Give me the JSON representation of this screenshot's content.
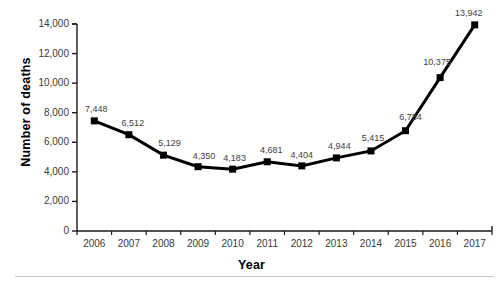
{
  "chart_data": {
    "type": "line",
    "title": "",
    "xlabel": "Year",
    "ylabel": "Number of deaths",
    "categories": [
      "2006",
      "2007",
      "2008",
      "2009",
      "2010",
      "2011",
      "2012",
      "2013",
      "2014",
      "2015",
      "2016",
      "2017"
    ],
    "values": [
      7448,
      6512,
      5129,
      4350,
      4183,
      4681,
      4404,
      4944,
      5415,
      6784,
      10375,
      13942
    ],
    "point_labels": [
      "7,448",
      "6,512",
      "5,129",
      "4,350",
      "4,183",
      "4,681",
      "4,404",
      "4,944",
      "5,415",
      "6,784",
      "10,375",
      "13,942"
    ],
    "ylim": [
      0,
      14000
    ],
    "ytick_values": [
      0,
      2000,
      4000,
      6000,
      8000,
      10000,
      12000,
      14000
    ],
    "ytick_labels": [
      "0",
      "2,000",
      "4,000",
      "6,000",
      "8,000",
      "10,000",
      "12,000",
      "14,000"
    ],
    "xtick_labels": [
      "2006",
      "2007",
      "2008",
      "2009",
      "2010",
      "2011",
      "2012",
      "2013",
      "2014",
      "2015",
      "2016",
      "2017"
    ],
    "grid": false,
    "legend": null,
    "series": [
      {
        "name": "Number of deaths",
        "values": [
          7448,
          6512,
          5129,
          4350,
          4183,
          4681,
          4404,
          4944,
          5415,
          6784,
          10375,
          13942
        ],
        "line_color": "#000000",
        "marker": "square",
        "marker_color": "#000000"
      }
    ],
    "colors": {
      "line": "#000000",
      "marker": "#000000",
      "axis": "#1a1a1a",
      "tick_text": "#3a3a3a",
      "label_text": "#404040",
      "rule": "#c9c9c9",
      "background": "#ffffff"
    }
  }
}
